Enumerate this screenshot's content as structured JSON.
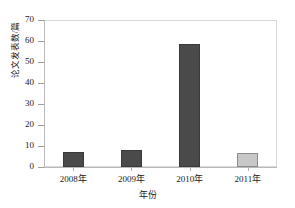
{
  "chart_data": {
    "type": "bar",
    "title": "",
    "xlabel": "年份",
    "ylabel": "论文发表数/篇",
    "categories": [
      "2008年",
      "2009年",
      "2010年",
      "2011年"
    ],
    "values": [
      7,
      8,
      59,
      6.5
    ],
    "ylim": [
      0,
      70
    ],
    "yticks": [
      0,
      10,
      20,
      30,
      40,
      50,
      60,
      70
    ],
    "ytick_labels": [
      "0",
      "10",
      "20",
      "30",
      "40",
      "50",
      "60",
      "70"
    ],
    "grid": false,
    "legend": null,
    "bar_colors": [
      "#4a4a4a",
      "#4a4a4a",
      "#4a4a4a",
      "#c8c8c8"
    ],
    "bar_border_colors": [
      "#3a3a3a",
      "#3a3a3a",
      "#3a3a3a",
      "#8c8c8c"
    ],
    "frame_color": "#d9d9d9",
    "axis_color": "#b9b9b9",
    "text_color": "#1a1a1a"
  }
}
